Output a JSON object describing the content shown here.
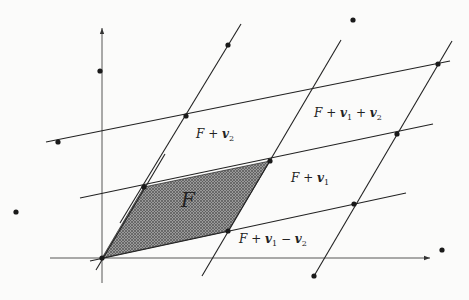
{
  "diagram": {
    "origin": [
      102,
      258
    ],
    "basis": {
      "v1": [
        126,
        -27
      ],
      "v2": [
        42,
        -71
      ]
    },
    "axes": {
      "x": {
        "from": [
          50,
          258
        ],
        "to": [
          430,
          258
        ]
      },
      "y": {
        "from": [
          102,
          283
        ],
        "to": [
          102,
          28
        ]
      }
    },
    "lines_v1_direction": [
      {
        "from": [
          90,
          261
        ],
        "to": [
          406,
          193
        ]
      },
      {
        "from": [
          80,
          198
        ],
        "to": [
          433,
          124
        ]
      },
      {
        "from": [
          46,
          142
        ],
        "to": [
          450,
          61
        ]
      }
    ],
    "lines_v2_direction": [
      {
        "from": [
          96,
          270
        ],
        "to": [
          165,
          154
        ]
      },
      {
        "from": [
          202,
          276
        ],
        "to": [
          341,
          40
        ]
      },
      {
        "from": [
          314,
          276
        ],
        "to": [
          452,
          41
        ]
      },
      {
        "from": [
          120,
          223
        ],
        "to": [
          241,
          24
        ]
      }
    ],
    "points": [
      [
        102,
        258
      ],
      [
        144,
        187
      ],
      [
        228,
        231
      ],
      [
        270,
        161
      ],
      [
        186,
        116
      ],
      [
        228,
        45
      ],
      [
        354,
        204
      ],
      [
        397,
        134
      ],
      [
        438,
        64
      ],
      [
        314,
        276
      ],
      [
        442,
        250
      ],
      [
        353,
        20
      ],
      [
        58,
        142
      ],
      [
        100,
        71
      ],
      [
        16,
        212
      ]
    ],
    "fundamental_domain": [
      [
        102,
        258
      ],
      [
        228,
        231
      ],
      [
        270,
        161
      ],
      [
        144,
        187
      ]
    ],
    "labels": {
      "F": {
        "text": "F",
        "pos": [
          181,
          196
        ]
      },
      "F_v2": {
        "prefix": "F + ",
        "v": "v",
        "sub": "2",
        "pos": [
          196,
          134
        ]
      },
      "F_v1_v2": {
        "prefix": "F + ",
        "v1": "v",
        "sub1": "1",
        "op": " + ",
        "v2": "v",
        "sub2": "2",
        "pos": [
          314,
          113
        ]
      },
      "F_v1": {
        "prefix": "F + ",
        "v": "v",
        "sub": "1",
        "pos": [
          291,
          178
        ]
      },
      "F_v1_minus_v2": {
        "prefix": "F + ",
        "v1": "v",
        "sub1": "1",
        "op": " − ",
        "v2": "v",
        "sub2": "2",
        "pos": [
          239,
          239
        ]
      }
    },
    "colors": {
      "ink": "#222222",
      "hatch": "#6a6a6a",
      "background": "#fbfbfa"
    }
  }
}
